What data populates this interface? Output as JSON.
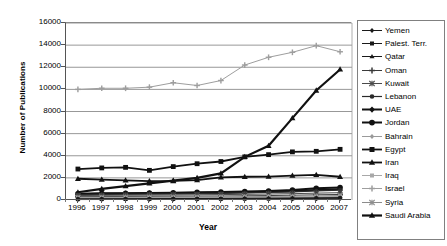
{
  "axes": {
    "ylabel": "Number of Publications",
    "xlabel": "Year",
    "yticks": [
      "16000",
      "14000",
      "12000",
      "10000",
      "8000",
      "6000",
      "4000",
      "2000",
      "0"
    ],
    "xticks": [
      "1996",
      "1997",
      "1998",
      "1999",
      "2000",
      "2001",
      "2002",
      "2003",
      "2004",
      "2005",
      "2006",
      "2007"
    ]
  },
  "legend": {
    "items": [
      {
        "label": "Yemen",
        "marker": "diamond",
        "color": "#1a1a1a",
        "width": 1.0
      },
      {
        "label": "Palest. Terr.",
        "marker": "square",
        "color": "#1a1a1a",
        "width": 1.0
      },
      {
        "label": "Qatar",
        "marker": "triangle",
        "color": "#1a1a1a",
        "width": 1.0
      },
      {
        "label": "Oman",
        "marker": "cross",
        "color": "#3a3a3a",
        "width": 1.0
      },
      {
        "label": "Kuwait",
        "marker": "star",
        "color": "#4a4a4a",
        "width": 1.0
      },
      {
        "label": "Lebanon",
        "marker": "circle",
        "color": "#2a2a2a",
        "width": 1.2
      },
      {
        "label": "UAE",
        "marker": "diamond",
        "color": "#111111",
        "width": 2.0
      },
      {
        "label": "Jordan",
        "marker": "circle",
        "color": "#111111",
        "width": 2.0
      },
      {
        "label": "Bahrain",
        "marker": "diamond",
        "color": "#9a9a9a",
        "width": 1.0
      },
      {
        "label": "Egypt",
        "marker": "square",
        "color": "#111111",
        "width": 1.8
      },
      {
        "label": "Iran",
        "marker": "triangle",
        "color": "#111111",
        "width": 1.8
      },
      {
        "label": "Iraq",
        "marker": "square",
        "color": "#a8a8a8",
        "width": 1.0
      },
      {
        "label": "Israel",
        "marker": "cross",
        "color": "#9e9e9e",
        "width": 1.0
      },
      {
        "label": "Syria",
        "marker": "star",
        "color": "#8c8c8c",
        "width": 1.0
      },
      {
        "label": "Saudi Arabia",
        "marker": "triangle",
        "color": "#111111",
        "width": 2.2
      }
    ]
  },
  "chart_data": {
    "type": "line",
    "title": "",
    "xlabel": "Year",
    "ylabel": "Number of Publications",
    "x": [
      1996,
      1997,
      1998,
      1999,
      2000,
      2001,
      2002,
      2003,
      2004,
      2005,
      2006,
      2007
    ],
    "ylim": [
      0,
      16000
    ],
    "ytick_step": 2000,
    "grid": "horizontal",
    "legend_position": "right",
    "series": [
      {
        "name": "Israel",
        "marker": "cross",
        "color": "#9e9e9e",
        "values": [
          10000,
          10100,
          10100,
          10200,
          10600,
          10350,
          10800,
          12200,
          12900,
          13350,
          13950,
          13400
        ]
      },
      {
        "name": "Saudi Arabia",
        "marker": "triangle",
        "color": "#111111",
        "values": [
          700,
          1000,
          1250,
          1500,
          1750,
          2000,
          2400,
          3900,
          4900,
          7400,
          9900,
          11800
        ]
      },
      {
        "name": "Egypt",
        "marker": "square",
        "color": "#111111",
        "values": [
          2800,
          2900,
          2950,
          2680,
          3020,
          3280,
          3480,
          3900,
          4100,
          4350,
          4400,
          4580
        ]
      },
      {
        "name": "Iran",
        "marker": "triangle",
        "color": "#111111",
        "values": [
          1920,
          1850,
          1780,
          1700,
          1720,
          1800,
          2050,
          2100,
          2120,
          2200,
          2280,
          2100
        ]
      },
      {
        "name": "Jordan",
        "marker": "circle",
        "color": "#111111",
        "values": [
          560,
          600,
          620,
          640,
          660,
          690,
          720,
          760,
          820,
          900,
          1060,
          1140
        ]
      },
      {
        "name": "UAE",
        "marker": "diamond",
        "color": "#111111",
        "values": [
          520,
          560,
          580,
          600,
          620,
          640,
          660,
          700,
          740,
          800,
          900,
          980
        ]
      },
      {
        "name": "Lebanon",
        "marker": "circle",
        "color": "#2a2a2a",
        "values": [
          480,
          500,
          520,
          540,
          560,
          580,
          600,
          640,
          680,
          740,
          820,
          900
        ]
      },
      {
        "name": "Kuwait",
        "marker": "star",
        "color": "#4a4a4a",
        "values": [
          400,
          420,
          430,
          440,
          450,
          470,
          490,
          510,
          540,
          570,
          620,
          660
        ]
      },
      {
        "name": "Oman",
        "marker": "cross",
        "color": "#3a3a3a",
        "values": [
          300,
          310,
          320,
          330,
          340,
          350,
          360,
          380,
          400,
          430,
          470,
          500
        ]
      },
      {
        "name": "Syria",
        "marker": "star",
        "color": "#8c8c8c",
        "values": [
          240,
          250,
          255,
          260,
          270,
          275,
          285,
          300,
          320,
          340,
          370,
          400
        ]
      },
      {
        "name": "Iraq",
        "marker": "square",
        "color": "#a8a8a8",
        "values": [
          200,
          205,
          210,
          215,
          220,
          225,
          230,
          240,
          255,
          270,
          290,
          310
        ]
      },
      {
        "name": "Bahrain",
        "marker": "diamond",
        "color": "#9a9a9a",
        "values": [
          160,
          165,
          170,
          175,
          180,
          185,
          190,
          200,
          210,
          225,
          245,
          265
        ]
      },
      {
        "name": "Qatar",
        "marker": "triangle",
        "color": "#1a1a1a",
        "values": [
          110,
          115,
          120,
          125,
          130,
          135,
          140,
          150,
          160,
          175,
          195,
          215
        ]
      },
      {
        "name": "Palest. Terr.",
        "marker": "square",
        "color": "#1a1a1a",
        "values": [
          70,
          75,
          80,
          85,
          90,
          95,
          100,
          110,
          120,
          135,
          150,
          170
        ]
      },
      {
        "name": "Yemen",
        "marker": "diamond",
        "color": "#1a1a1a",
        "values": [
          40,
          45,
          48,
          52,
          56,
          60,
          64,
          70,
          78,
          88,
          100,
          115
        ]
      }
    ]
  }
}
